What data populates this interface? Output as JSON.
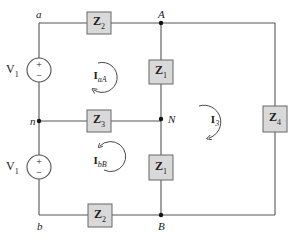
{
  "diagram": {
    "type": "three-phase circuit schematic",
    "nodes": {
      "a": "a",
      "A": "A",
      "n": "n",
      "N": "N",
      "b": "b",
      "B": "B"
    },
    "sources": [
      {
        "id": "top",
        "label": "V",
        "sub": "1",
        "plus": "+",
        "minus": "−"
      },
      {
        "id": "bottom",
        "label": "V",
        "sub": "1",
        "plus": "+",
        "minus": "−"
      }
    ],
    "impedances": [
      {
        "id": "z2-top",
        "label": "Z",
        "sub": "2"
      },
      {
        "id": "z1-top",
        "label": "Z",
        "sub": "1"
      },
      {
        "id": "z3",
        "label": "Z",
        "sub": "3"
      },
      {
        "id": "z1-bottom",
        "label": "Z",
        "sub": "1"
      },
      {
        "id": "z2-bottom",
        "label": "Z",
        "sub": "2"
      },
      {
        "id": "z4",
        "label": "Z",
        "sub": "4"
      }
    ],
    "mesh_currents": [
      {
        "id": "IaA",
        "label": "I",
        "sub": "aA",
        "direction": "clockwise"
      },
      {
        "id": "IbB",
        "label": "I",
        "sub": "bB",
        "direction": "counterclockwise"
      },
      {
        "id": "I3",
        "label": "I",
        "sub": "3",
        "direction": "clockwise"
      }
    ],
    "colors": {
      "wire": "#555555",
      "impedance_fill": "#d9d9d9",
      "node": "#111111"
    }
  }
}
